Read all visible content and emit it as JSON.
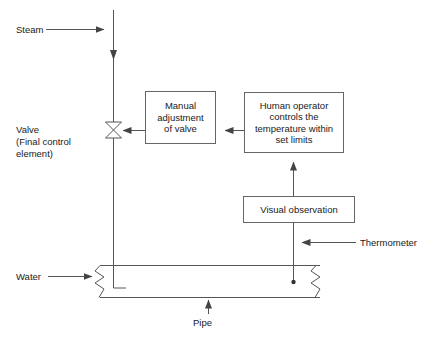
{
  "diagram": {
    "colors": {
      "line": "#555555",
      "box_border": "#666666",
      "text": "#1a1a1a",
      "background": "#ffffff"
    },
    "boxes": [
      {
        "id": "manual-adjustment",
        "text": "Manual\nadjustment\nof valve",
        "x": 145,
        "y": 91,
        "w": 70,
        "h": 52
      },
      {
        "id": "human-operator",
        "text": "Human operator\ncontrols the\ntemperature within\nset limits",
        "x": 244,
        "y": 92,
        "w": 99,
        "h": 60
      },
      {
        "id": "visual-observation",
        "text": "Visual observation",
        "x": 243,
        "y": 196,
        "w": 111,
        "h": 26
      }
    ],
    "labels": {
      "steam": "Steam",
      "valve": "Valve\n(Final control\nelement)",
      "water": "Water",
      "pipe": "Pipe",
      "thermometer": "Thermometer"
    },
    "symbols": {
      "valve": "valve-bowtie-icon",
      "pipe_break_left": "zigzag-break-icon",
      "pipe_break_right": "zigzag-break-icon",
      "probe_tip": "probe-dot-icon"
    },
    "flow": [
      {
        "from": "steam-inlet",
        "to": "steam-riser",
        "direction": "right"
      },
      {
        "from": "steam-riser",
        "to": "valve",
        "direction": "down"
      },
      {
        "from": "valve",
        "to": "pipe-jacket",
        "direction": "down"
      },
      {
        "from": "human-operator",
        "to": "manual-adjustment",
        "direction": "left"
      },
      {
        "from": "manual-adjustment",
        "to": "valve",
        "direction": "left"
      },
      {
        "from": "visual-observation",
        "to": "human-operator",
        "direction": "up"
      },
      {
        "from": "thermometer-probe",
        "to": "visual-observation",
        "direction": "up"
      },
      {
        "from": "water-inlet",
        "to": "pipe",
        "direction": "right"
      }
    ]
  }
}
